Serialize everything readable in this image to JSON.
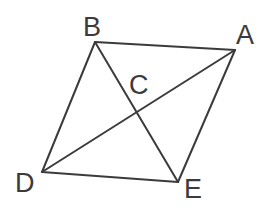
{
  "figure": {
    "canvas": {
      "width": 278,
      "height": 214,
      "background": "#ffffff"
    },
    "style": {
      "stroke_color": "#3b3b3b",
      "stroke_width": 2,
      "label_color": "#3b3b3b",
      "label_font_size": 27
    },
    "points": [
      {
        "id": "B",
        "label": "B",
        "x": 95,
        "y": 42,
        "label_x": 83,
        "label_y": 14
      },
      {
        "id": "A",
        "label": "A",
        "x": 235,
        "y": 50,
        "label_x": 236,
        "label_y": 22
      },
      {
        "id": "C",
        "label": "C",
        "x": 136,
        "y": 112,
        "label_x": 129,
        "label_y": 72
      },
      {
        "id": "D",
        "label": "D",
        "x": 42,
        "y": 172,
        "label_x": 15,
        "label_y": 170
      },
      {
        "id": "E",
        "label": "E",
        "x": 178,
        "y": 182,
        "label_x": 184,
        "label_y": 176
      }
    ],
    "segments": [
      {
        "id": "side-BA",
        "from": "B",
        "to": "A",
        "x1": 95,
        "y1": 42,
        "x2": 235,
        "y2": 50
      },
      {
        "id": "side-AE",
        "from": "A",
        "to": "E",
        "x1": 235,
        "y1": 50,
        "x2": 178,
        "y2": 182
      },
      {
        "id": "side-ED",
        "from": "E",
        "to": "D",
        "x1": 178,
        "y1": 182,
        "x2": 42,
        "y2": 172
      },
      {
        "id": "side-DB",
        "from": "D",
        "to": "B",
        "x1": 42,
        "y1": 172,
        "x2": 95,
        "y2": 42
      },
      {
        "id": "diagonal-BE",
        "from": "B",
        "to": "E",
        "x1": 95,
        "y1": 42,
        "x2": 178,
        "y2": 182
      },
      {
        "id": "diagonal-DA",
        "from": "D",
        "to": "A",
        "x1": 42,
        "y1": 172,
        "x2": 235,
        "y2": 50
      }
    ]
  }
}
